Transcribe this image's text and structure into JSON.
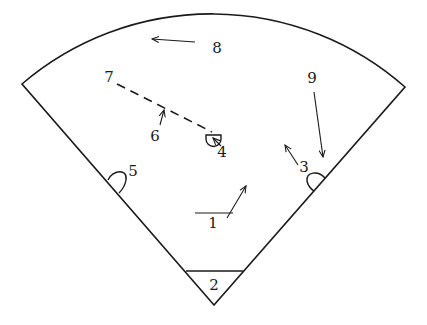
{
  "diagram": {
    "type": "sector-field-diagram",
    "colors": {
      "stroke": "#1a1a1a",
      "background": "#ffffff"
    },
    "labels": [
      {
        "id": "1",
        "text": "1",
        "x": 213,
        "y": 228
      },
      {
        "id": "2",
        "text": "2",
        "x": 214,
        "y": 290
      },
      {
        "id": "3",
        "text": "3",
        "x": 304,
        "y": 172
      },
      {
        "id": "4",
        "text": "4",
        "x": 222,
        "y": 157
      },
      {
        "id": "5",
        "text": "5",
        "x": 133,
        "y": 176
      },
      {
        "id": "6",
        "text": "6",
        "x": 155,
        "y": 141
      },
      {
        "id": "7",
        "text": "7",
        "x": 109,
        "y": 82
      },
      {
        "id": "8",
        "text": "8",
        "x": 217,
        "y": 53
      },
      {
        "id": "9",
        "text": "9",
        "x": 312,
        "y": 83
      }
    ],
    "arrows": [
      {
        "id": "arrow-1",
        "from": [
          227,
          218
        ],
        "to": [
          246,
          186
        ]
      },
      {
        "id": "arrow-3",
        "from": [
          298,
          165
        ],
        "to": [
          285,
          145
        ]
      },
      {
        "id": "arrow-4",
        "from": [
          221,
          146
        ],
        "to": [
          213,
          138
        ]
      },
      {
        "id": "arrow-6",
        "from": [
          160,
          125
        ],
        "to": [
          164,
          110
        ]
      },
      {
        "id": "arrow-8",
        "from": [
          195,
          42
        ],
        "to": [
          152,
          39
        ]
      },
      {
        "id": "arrow-9",
        "from": [
          314,
          92
        ],
        "to": [
          323,
          157
        ]
      }
    ],
    "dashed_line": {
      "from": [
        117,
        84
      ],
      "to": [
        212,
        132
      ]
    },
    "line_1": {
      "from": [
        195,
        213
      ],
      "to": [
        233,
        213
      ]
    },
    "home_triangle_base": {
      "from": [
        186,
        271
      ],
      "to": [
        243,
        271
      ]
    }
  }
}
